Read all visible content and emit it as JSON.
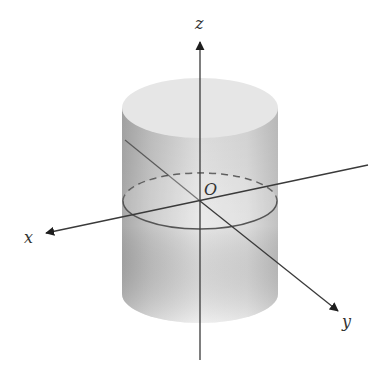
{
  "diagram": {
    "type": "3d-cylinder-with-axes",
    "labels": {
      "x": "x",
      "y": "y",
      "z": "z",
      "origin": "O"
    },
    "colors": {
      "background": "#ffffff",
      "cylinder_light": "#ececec",
      "cylinder_dark": "#b8b8b8",
      "top_face": "#e4e4e4",
      "axis": "#3a3a3a",
      "ellipse": "#555555"
    },
    "geometry": {
      "origin": [
        200,
        201
      ],
      "cylinder": {
        "cx": 200,
        "rx": 78,
        "ry": 29,
        "top_cy": 108,
        "bottom_cy": 294
      },
      "mid_ellipse": {
        "cx": 200,
        "cy": 201,
        "rx": 77,
        "ry": 28
      },
      "z_axis": {
        "from": [
          200,
          360
        ],
        "to": [
          200,
          40
        ]
      },
      "x_axis": {
        "from": [
          368,
          165
        ],
        "to": [
          44,
          233
        ]
      },
      "y_axis": {
        "from": [
          125,
          140
        ],
        "to": [
          340,
          312
        ]
      }
    }
  }
}
